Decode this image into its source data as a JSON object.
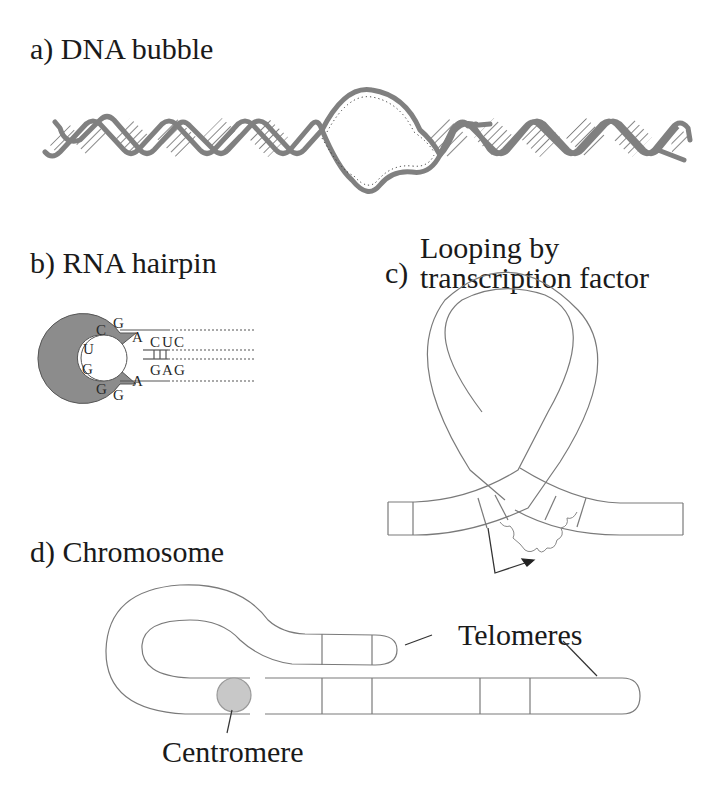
{
  "figure": {
    "panels": [
      {
        "id": "a",
        "label": "a)  DNA bubble"
      },
      {
        "id": "b",
        "label": "b)  RNA hairpin"
      },
      {
        "id": "c",
        "prefix": "c)",
        "line1": "Looping by",
        "line2": "transcription factor"
      },
      {
        "id": "d",
        "label": "d)  Chromosome"
      }
    ],
    "rna_hairpin": {
      "loop_bases": [
        "U",
        "C",
        "G",
        "A",
        "G",
        "G",
        "G",
        "A"
      ],
      "stem_top": [
        "C",
        "U",
        "C"
      ],
      "stem_bottom": [
        "G",
        "A",
        "G"
      ]
    },
    "chromosome": {
      "telomeres_label": "Telomeres",
      "centromere_label": "Centromere"
    },
    "colors": {
      "strand_gray": "#808080",
      "ring_gray": "#8c8c8c",
      "centromere_fill": "#c8c8c8",
      "line": "#7a7a7a",
      "text": "#1a1a1a"
    }
  }
}
